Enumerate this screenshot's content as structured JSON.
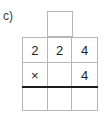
{
  "exercise": {
    "part_label": "c)",
    "operation_symbol": "×",
    "carry_box": {
      "name": "carry-box",
      "value": ""
    },
    "grid": {
      "columns": 3,
      "rows": 3,
      "cells": [
        [
          {
            "value": "2",
            "kind": "digit"
          },
          {
            "value": "2",
            "kind": "digit"
          },
          {
            "value": "4",
            "kind": "digit"
          }
        ],
        [
          {
            "value": "×",
            "kind": "operator"
          },
          {
            "value": "",
            "kind": "blank"
          },
          {
            "value": "4",
            "kind": "digit"
          }
        ],
        [
          {
            "value": "",
            "kind": "blank"
          },
          {
            "value": "",
            "kind": "blank"
          },
          {
            "value": "",
            "kind": "blank"
          }
        ]
      ]
    },
    "colors": {
      "grid_line": "#b6b6b6",
      "rule_line": "#1d1d1d",
      "text": "#1d1d1d",
      "label_text": "#3a3a3a",
      "background": "#ffffff"
    }
  }
}
